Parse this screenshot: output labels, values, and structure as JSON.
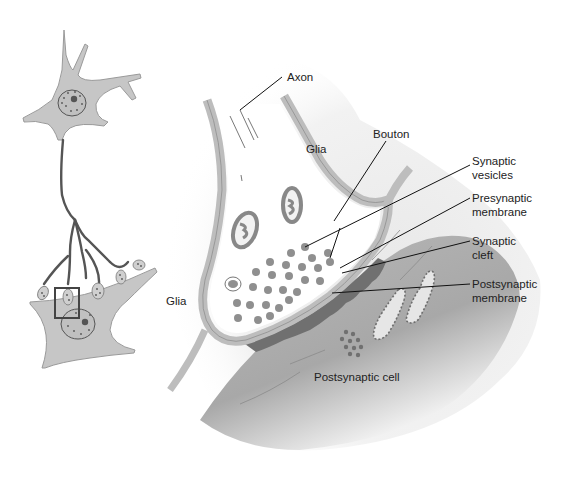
{
  "diagram": {
    "colors": {
      "cell_fill": "#c4c4c4",
      "axon_stroke": "#555555",
      "membrane_fill": "#c8c8c8",
      "vesicle_fill": "#8f8f8f",
      "postsynaptic_density": "#6e6e6e",
      "label_text": "#222222",
      "leader_line": "#111111",
      "inset_box": "#444444"
    },
    "overview": {
      "presynaptic_neuron": "Presynaptic neuron with dendrites and nucleus",
      "postsynaptic_neuron": "Postsynaptic neuron receiving axon terminals",
      "inset_marker": "Boxed region enlarged at right"
    },
    "labels": {
      "axon": "Axon",
      "glia_top": "Glia",
      "bouton": "Bouton",
      "synaptic_vesicles": [
        "Synaptic",
        "vesicles"
      ],
      "presynaptic_membrane": [
        "Presynaptic",
        "membrane"
      ],
      "synaptic_cleft": [
        "Synaptic",
        "cleft"
      ],
      "postsynaptic_membrane": [
        "Postsynaptic",
        "membrane"
      ],
      "glia_left": "Glia",
      "postsynaptic_cell": "Postsynaptic cell"
    }
  }
}
